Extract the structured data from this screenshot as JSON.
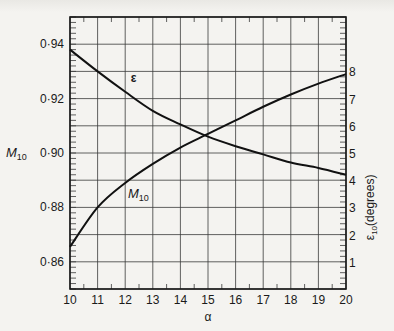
{
  "chart_data": {
    "type": "line",
    "title": "",
    "xlabel": "α",
    "ylabel": "M10",
    "y2label": "ε10(degrees)",
    "x": [
      10,
      11,
      12,
      13,
      14,
      15,
      16,
      17,
      18,
      19,
      20
    ],
    "xlim": [
      10,
      20
    ],
    "ylim": [
      0.85,
      0.95
    ],
    "y2lim": [
      0,
      10
    ],
    "x_ticks": [
      "10",
      "11",
      "12",
      "13",
      "14",
      "15",
      "16",
      "17",
      "18",
      "19",
      "20"
    ],
    "y_ticks": [
      "0·86",
      "0·88",
      "0·90",
      "0·92",
      "0·94"
    ],
    "y2_ticks": [
      "1",
      "2",
      "3",
      "4",
      "5",
      "6",
      "7",
      "8"
    ],
    "grid": true,
    "series": [
      {
        "name": "M10",
        "label": "M",
        "label_sub": "10",
        "axis": "left",
        "values": [
          0.8655,
          0.88,
          0.889,
          0.896,
          0.902,
          0.907,
          0.912,
          0.917,
          0.9215,
          0.9255,
          0.929
        ]
      },
      {
        "name": "ε",
        "label": "ε",
        "axis": "right",
        "values": [
          8.8,
          8.0,
          7.25,
          6.55,
          6.05,
          5.6,
          5.25,
          4.95,
          4.65,
          4.45,
          4.2
        ]
      }
    ],
    "annotations": [
      {
        "text": "ε",
        "near": "epsilon curve at α≈12.2"
      },
      {
        "text": "M10",
        "near": "M10 curve at α≈12.3"
      }
    ]
  }
}
